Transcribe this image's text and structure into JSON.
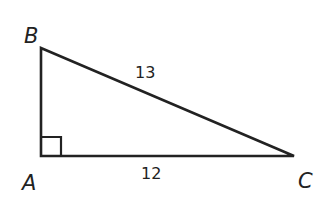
{
  "diagram": {
    "type": "right-triangle",
    "vertices": {
      "A": {
        "label": "A",
        "x": 41,
        "y": 156
      },
      "B": {
        "label": "B",
        "x": 41,
        "y": 48
      },
      "C": {
        "label": "C",
        "x": 294,
        "y": 156
      }
    },
    "sides": {
      "hypotenuse_BC": "13",
      "base_AC": "12"
    },
    "right_angle_at": "A",
    "stroke_color": "#222222"
  }
}
